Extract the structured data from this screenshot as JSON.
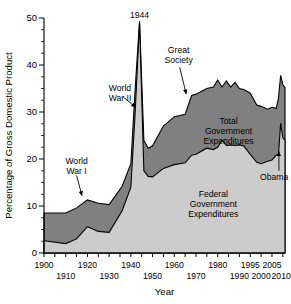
{
  "chart_data": {
    "type": "area",
    "title": "",
    "xlabel": "Year",
    "ylabel": "Percentage of Gross Domestic Product",
    "xlim": [
      1900,
      2011
    ],
    "ylim": [
      0,
      50
    ],
    "grid": false,
    "legend": "inline-labels",
    "ytick_labels": [
      "0",
      "10",
      "20",
      "30",
      "40",
      "50"
    ],
    "ytick_values": [
      0,
      10,
      20,
      30,
      40,
      50
    ],
    "yminor_step": 2.5,
    "xtick_labels_top": [
      "1900",
      "1920",
      "1940",
      "1960",
      "1980",
      "1995",
      "2005"
    ],
    "xtick_values_top": [
      1900,
      1920,
      1940,
      1960,
      1980,
      1995,
      2005
    ],
    "xtick_labels_bottom": [
      "1910",
      "1930",
      "1950",
      "1970",
      "1990",
      "2000",
      "2010*"
    ],
    "xtick_values_bottom": [
      1910,
      1930,
      1950,
      1970,
      1990,
      2000,
      2010
    ],
    "series": [
      {
        "name": "Total Government Expenditures",
        "color": "#808080",
        "x": [
          1900,
          1910,
          1915,
          1920,
          1925,
          1930,
          1936,
          1940,
          1942,
          1944,
          1946,
          1948,
          1950,
          1955,
          1960,
          1965,
          1968,
          1970,
          1975,
          1978,
          1980,
          1982,
          1984,
          1986,
          1988,
          1990,
          1992,
          1995,
          1998,
          2000,
          2003,
          2005,
          2007,
          2008,
          2009,
          2010,
          2011
        ],
        "values": [
          8.5,
          8.5,
          9.6,
          11.3,
          10.6,
          10.3,
          14.2,
          19.0,
          35.0,
          49.3,
          24.0,
          22.3,
          22.8,
          27.0,
          29.0,
          29.5,
          33.5,
          33.8,
          35.0,
          35.3,
          36.8,
          35.3,
          36.6,
          35.3,
          36.3,
          35.0,
          34.8,
          34.0,
          31.5,
          31.2,
          30.6,
          31.0,
          30.8,
          33.0,
          37.8,
          35.8,
          35.2
        ]
      },
      {
        "name": "Federal Government Expenditures",
        "color": "#cccccc",
        "x": [
          1900,
          1910,
          1915,
          1920,
          1925,
          1930,
          1936,
          1940,
          1942,
          1944,
          1946,
          1948,
          1950,
          1955,
          1960,
          1965,
          1968,
          1970,
          1975,
          1978,
          1980,
          1982,
          1984,
          1986,
          1988,
          1990,
          1992,
          1995,
          1998,
          2000,
          2003,
          2005,
          2007,
          2008,
          2009,
          2010,
          2011
        ],
        "values": [
          2.6,
          2.0,
          3.0,
          5.6,
          4.6,
          4.4,
          9.0,
          14.0,
          30.0,
          49.0,
          17.5,
          16.3,
          16.2,
          18.0,
          18.8,
          19.2,
          20.8,
          21.0,
          22.3,
          22.0,
          22.5,
          24.0,
          22.9,
          23.0,
          22.9,
          23.0,
          22.8,
          21.0,
          19.3,
          19.0,
          19.5,
          19.8,
          20.8,
          21.0,
          27.6,
          24.5,
          24.0
        ]
      }
    ],
    "annotations": [
      {
        "id": "peak-1944",
        "text": "1944",
        "x": 1944,
        "y": 50.0
      },
      {
        "id": "world-war-ii",
        "text": "World\nWar II",
        "x": 1935,
        "y": 34.5
      },
      {
        "id": "world-war-i",
        "text": "World\nWar I",
        "x": 1915,
        "y": 19.0
      },
      {
        "id": "great-society",
        "text": "Great\nSociety",
        "x": 1962,
        "y": 42.5
      },
      {
        "id": "obama",
        "text": "Obama",
        "x": 2006,
        "y": 15.5
      }
    ],
    "inline_labels": [
      {
        "id": "total-label",
        "text": "Total\nGovernment\nExpenditures",
        "x": 1985,
        "y": 27.5
      },
      {
        "id": "federal-label",
        "text": "Federal\nGovernment\nExpenditures",
        "x": 1978,
        "y": 12.0
      }
    ]
  }
}
